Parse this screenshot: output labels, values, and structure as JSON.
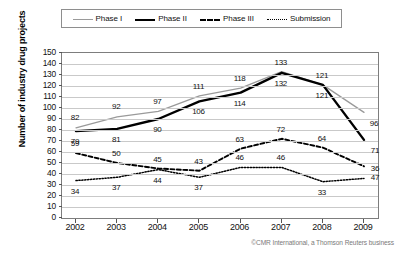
{
  "legend": {
    "position": "top",
    "entries": [
      {
        "label": "Phase I",
        "icon": "line-solid-gray-icon",
        "style": "solid-gray"
      },
      {
        "label": "Phase II",
        "icon": "line-solid-black-icon",
        "style": "solid-black-thick"
      },
      {
        "label": "Phase III",
        "icon": "line-dashed-icon",
        "style": "dashed-black"
      },
      {
        "label": "Submission",
        "icon": "line-dotted-icon",
        "style": "dotted-black"
      }
    ]
  },
  "credit": "©CMR International, a Thomson Reuters business",
  "colors": {
    "phase1": "#9a9a9a",
    "phase2": "#000000",
    "phase3": "#000000",
    "submission": "#000000",
    "grid": "#c9c9c9",
    "frame": "#7d7d7d"
  },
  "chart_data": {
    "type": "line",
    "title": "",
    "subtitle": "",
    "xlabel": "",
    "ylabel": "Number of industry drug projects",
    "categories": [
      "2002",
      "2003",
      "2004",
      "2005",
      "2006",
      "2007",
      "2008",
      "2009"
    ],
    "x": [
      2002,
      2003,
      2004,
      2005,
      2006,
      2007,
      2008,
      2009
    ],
    "ylim": [
      0,
      150
    ],
    "ytick_labels": [
      "0",
      "10",
      "20",
      "30",
      "40",
      "50",
      "60",
      "70",
      "80",
      "90",
      "100",
      "110",
      "120",
      "130",
      "140",
      "150"
    ],
    "ytick_values": [
      0,
      10,
      20,
      30,
      40,
      50,
      60,
      70,
      80,
      90,
      100,
      110,
      120,
      130,
      140,
      150
    ],
    "grid": true,
    "legend_position": "top",
    "data_labels": true,
    "series": [
      {
        "name": "Phase I",
        "values": [
          82,
          92,
          97,
          111,
          118,
          133,
          121,
          96
        ]
      },
      {
        "name": "Phase II",
        "values": [
          79,
          81,
          90,
          106,
          114,
          132,
          121,
          71
        ]
      },
      {
        "name": "Phase III",
        "values": [
          59,
          50,
          45,
          43,
          63,
          72,
          64,
          47
        ]
      },
      {
        "name": "Submission",
        "values": [
          34,
          37,
          44,
          37,
          46,
          46,
          33,
          36
        ]
      }
    ]
  }
}
